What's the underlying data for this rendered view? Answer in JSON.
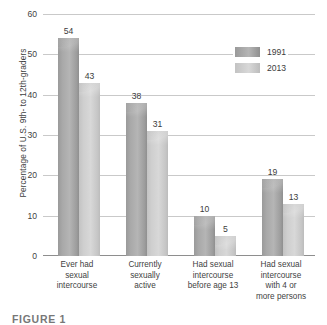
{
  "chart_data": {
    "type": "bar",
    "title": "",
    "xlabel": "",
    "ylabel": "Percentage of U.S. 9th- to 12th-graders",
    "ylim": [
      0,
      60
    ],
    "yticks": [
      0,
      10,
      20,
      30,
      40,
      50,
      60
    ],
    "grid": true,
    "legend_position": "top-right",
    "categories": [
      "Ever had sexual intercourse",
      "Currently sexually active",
      "Had sexual intercourse before age 13",
      "Had sexual intercourse with 4 or more persons"
    ],
    "category_lines": [
      [
        "Ever had",
        "sexual",
        "intercourse"
      ],
      [
        "Currently",
        "sexually",
        "active"
      ],
      [
        "Had sexual",
        "intercourse",
        "before age 13"
      ],
      [
        "Had sexual",
        "intercourse",
        "with 4 or",
        "more persons"
      ]
    ],
    "series": [
      {
        "name": "1991",
        "color": "#a8a8a8",
        "values": [
          54,
          38,
          10,
          19
        ]
      },
      {
        "name": "2013",
        "color": "#d0d0d0",
        "values": [
          43,
          31,
          5,
          13
        ]
      }
    ]
  },
  "legend": {
    "items": [
      {
        "label": "1991"
      },
      {
        "label": "2013"
      }
    ]
  },
  "caption": {
    "text": "FIGURE 1"
  }
}
